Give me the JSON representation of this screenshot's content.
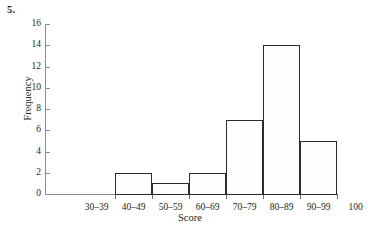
{
  "figure": {
    "problem_number": "5."
  },
  "chart_data": {
    "type": "bar",
    "title": "",
    "subtitle": "",
    "xlabel": "Score",
    "ylabel": "Frequency",
    "categories": [
      "30–39",
      "40–49",
      "50–59",
      "60–69",
      "70–79",
      "80–89",
      "90–99"
    ],
    "values": [
      0,
      2,
      1,
      2,
      7,
      14,
      5
    ],
    "xtick_labels": [
      "30–39",
      "40–49",
      "50–59",
      "60–69",
      "70–79",
      "80–89",
      "90–99",
      "100"
    ],
    "ytick_labels": [
      "0",
      "2",
      "4",
      "6",
      "8",
      "10",
      "12",
      "14",
      "16"
    ],
    "yticks": [
      0,
      2,
      4,
      6,
      8,
      10,
      12,
      14,
      16
    ],
    "ylim": [
      0,
      16
    ],
    "xlim": [
      30,
      110
    ],
    "bin_edges": [
      30,
      40,
      50,
      60,
      70,
      80,
      90,
      100
    ],
    "grid": false,
    "legend": false,
    "bar_fill": "#fdfdfd",
    "bar_edge": "#2b2b2b",
    "axis_color": "#8c8c8c"
  }
}
